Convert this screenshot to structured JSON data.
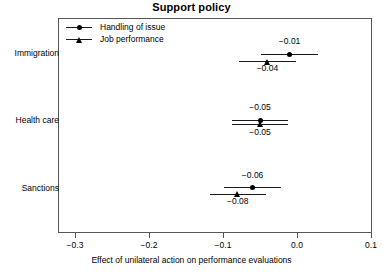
{
  "chart_data": {
    "type": "scatter",
    "title": "Support policy",
    "xlabel": "Effect of unilateral action on performance evaluations",
    "ylabel": "",
    "xlim": [
      -0.34,
      0.105
    ],
    "xticks": [
      -0.3,
      -0.2,
      -0.1,
      0.0,
      0.1
    ],
    "xtick_labels": [
      "−0.3",
      "−0.2",
      "−0.1",
      "0.0",
      "0.1"
    ],
    "grid": false,
    "legend_position": "top-left-inside",
    "categories": [
      "Immigration",
      "Health care",
      "Sanctions"
    ],
    "series": [
      {
        "name": "Handling of issue",
        "marker": "circle",
        "values": [
          -0.01,
          -0.05,
          -0.06
        ],
        "labels": [
          "−0.01",
          "−0.05",
          "−0.06"
        ],
        "ci_low": [
          -0.048,
          -0.088,
          -0.098
        ],
        "ci_high": [
          0.028,
          -0.012,
          -0.022
        ]
      },
      {
        "name": "Job performance",
        "marker": "triangle",
        "values": [
          -0.04,
          -0.05,
          -0.08
        ],
        "labels": [
          "−0.04",
          "−0.05",
          "−0.08"
        ],
        "ci_low": [
          -0.078,
          -0.088,
          -0.118
        ],
        "ci_high": [
          -0.002,
          -0.012,
          -0.042
        ]
      }
    ]
  },
  "legend": {
    "entries": [
      {
        "label": "Handling of issue",
        "marker": "circle"
      },
      {
        "label": "Job performance",
        "marker": "triangle"
      }
    ]
  },
  "axes": {
    "y_categories": [
      "Immigration",
      "Health care",
      "Sanctions"
    ],
    "x_tick_labels": [
      "−0.3",
      "−0.2",
      "−0.1",
      "0.0",
      "0.1"
    ]
  },
  "colors": {
    "marker": "#000000",
    "line": "#1a1a1a",
    "frame": "#555555",
    "background": "#ffffff"
  }
}
